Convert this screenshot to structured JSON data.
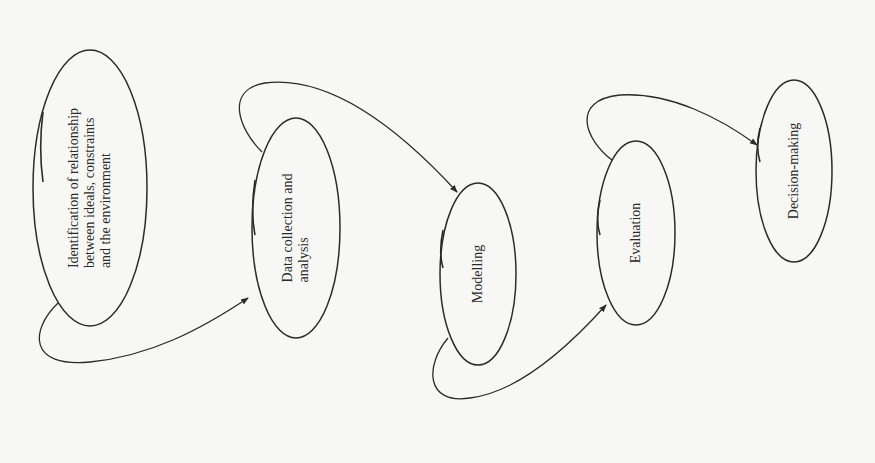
{
  "diagram": {
    "orientation": "rotated-90-ccw",
    "stroke_color": "#2b2b2b",
    "background": "#f7f7f5",
    "nodes": [
      {
        "id": "n1",
        "lines": [
          "Identification of relationship",
          "between ideals, constraints",
          "and the environment"
        ],
        "cx": 90,
        "cy": 188,
        "rx": 57,
        "ry": 138
      },
      {
        "id": "n2",
        "lines": [
          "Data collection and",
          "analysis"
        ],
        "cx": 296,
        "cy": 228,
        "rx": 44,
        "ry": 110
      },
      {
        "id": "n3",
        "lines": [
          "Modelling"
        ],
        "cx": 478,
        "cy": 274,
        "rx": 38,
        "ry": 91
      },
      {
        "id": "n4",
        "lines": [
          "Evaluation"
        ],
        "cx": 636,
        "cy": 233,
        "rx": 39,
        "ry": 92
      },
      {
        "id": "n5",
        "lines": [
          "Decision-making"
        ],
        "cx": 794,
        "cy": 171,
        "rx": 38,
        "ry": 91
      }
    ],
    "edges": [
      {
        "from": "n1",
        "to": "n2",
        "path": "M58,303 C30,330 28,368 90,362 C150,356 200,330 248,298"
      },
      {
        "from": "n2",
        "to": "n3",
        "path": "M262,152 C238,128 225,90 265,83 C330,75 400,130 457,192"
      },
      {
        "from": "n3",
        "to": "n4",
        "path": "M448,338 C425,365 425,405 470,398 C520,392 570,345 606,305"
      },
      {
        "from": "n4",
        "to": "n5",
        "path": "M612,160 C585,140 570,100 620,95 C670,92 720,118 757,145"
      }
    ],
    "accents": [
      "M43,112 C40,135 40,160 43,182",
      "M255,180 C252,200 252,220 255,235",
      "M443,230 C440,245 440,258 443,268",
      "M600,200 C597,212 597,225 600,235",
      "M760,128 C757,140 757,152 760,162"
    ]
  }
}
